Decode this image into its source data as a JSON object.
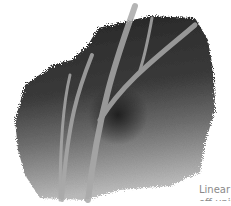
{
  "illustration": {
    "subject": "watercolor tree branches",
    "colors": {
      "dark": "#2a2a2a",
      "mid": "#6a6a6a",
      "light": "#b5b5b5",
      "branch": "#a8a8a8",
      "background": "#ffffff"
    }
  },
  "caption": {
    "line1": "Linear",
    "line2": "off unit"
  }
}
